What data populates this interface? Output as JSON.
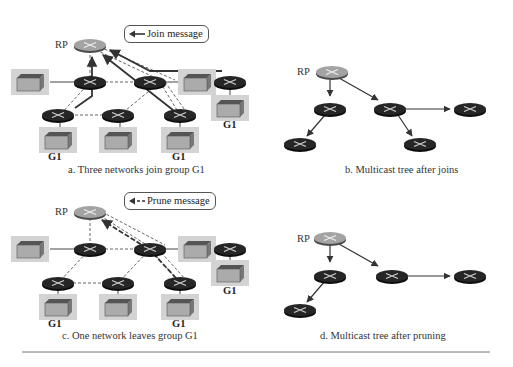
{
  "figure": {
    "panels": [
      {
        "id": "a",
        "caption": "a. Three networks join group G1",
        "legend": "Join message",
        "rp_label": "RP",
        "group_labels": [
          "G1",
          "G1",
          "G1"
        ]
      },
      {
        "id": "b",
        "caption": "b. Multicast tree after joins",
        "rp_label": "RP"
      },
      {
        "id": "c",
        "caption": "c. One network leaves group G1",
        "legend": "Prune message",
        "rp_label": "RP",
        "group_labels": [
          "G1",
          "G1",
          "G1"
        ]
      },
      {
        "id": "d",
        "caption": "d. Multicast tree after pruning",
        "rp_label": "RP"
      }
    ],
    "colors": {
      "router_dark": "#1e1e1e",
      "router_rp": "#9a9a9a",
      "host_bg": "#cfcfcf",
      "host_box": "#a9a9a9",
      "link": "#555555"
    }
  }
}
